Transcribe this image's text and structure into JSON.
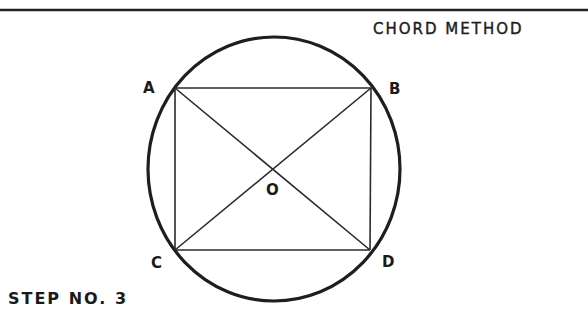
{
  "title": "CHORD METHOD",
  "step_label": "STEP NO. 3",
  "figure": {
    "points": {
      "A": "A",
      "B": "B",
      "C": "C",
      "D": "D",
      "O": "O"
    },
    "chords": [
      "AB",
      "CD",
      "AC",
      "BD"
    ],
    "diagonals": [
      "AD",
      "BC"
    ],
    "center_label": "O"
  },
  "colors": {
    "ink": "#1a1a1a",
    "background": "#ffffff"
  }
}
